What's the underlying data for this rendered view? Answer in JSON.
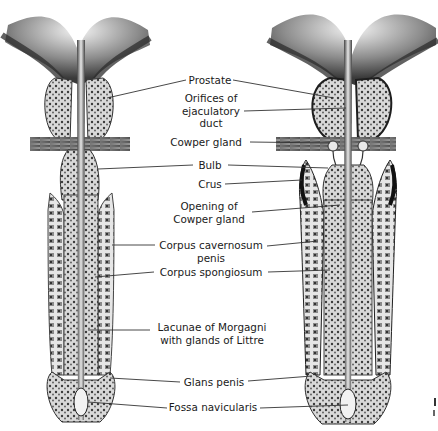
{
  "figure": {
    "labels": [
      {
        "id": "prostate",
        "lines": [
          "Prostate"
        ]
      },
      {
        "id": "orifices",
        "lines": [
          "Orifices of",
          "ejaculatory",
          "duct"
        ]
      },
      {
        "id": "cowper",
        "lines": [
          "Cowper gland"
        ]
      },
      {
        "id": "bulb",
        "lines": [
          "Bulb"
        ]
      },
      {
        "id": "crus",
        "lines": [
          "Crus"
        ]
      },
      {
        "id": "opening",
        "lines": [
          "Opening of",
          "Cowper gland"
        ]
      },
      {
        "id": "cavernosum",
        "lines": [
          "Corpus cavernosum",
          "penis"
        ]
      },
      {
        "id": "spongiosum",
        "lines": [
          "Corpus spongiosum"
        ]
      },
      {
        "id": "lacunae",
        "lines": [
          "Lacunae of  Morgagni",
          "with glands of Littre"
        ]
      },
      {
        "id": "glans",
        "lines": [
          "Glans penis"
        ]
      },
      {
        "id": "fossa",
        "lines": [
          "Fossa navicularis"
        ]
      }
    ]
  }
}
